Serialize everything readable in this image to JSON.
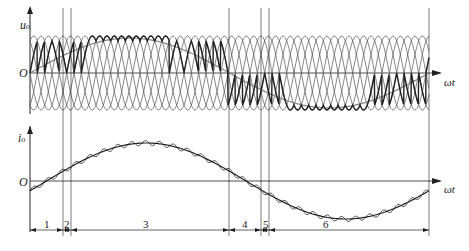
{
  "figure": {
    "top_plot": {
      "y_axis_label": "u",
      "y_axis_sub": "o",
      "origin_label": "O",
      "x_axis_label": "ωt",
      "description": "Cycloconverter output voltage built from segments of multi-phase supply voltages (thick line) with fundamental reference (grey)"
    },
    "bottom_plot": {
      "y_axis_label": "i",
      "y_axis_sub": "o",
      "origin_label": "O",
      "x_axis_label": "ωt",
      "description": "Output current: rippled actual current and smooth fundamental"
    },
    "intervals": [
      {
        "label": "1"
      },
      {
        "label": "2"
      },
      {
        "label": "3"
      },
      {
        "label": "4"
      },
      {
        "label": "5"
      },
      {
        "label": "6"
      }
    ],
    "colors": {
      "line": "#222222",
      "carrier": "#555555",
      "reference": "#888888"
    }
  }
}
